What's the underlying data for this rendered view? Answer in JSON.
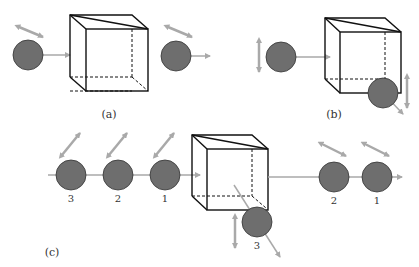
{
  "panels": {
    "a": {
      "label": "(a)"
    },
    "b": {
      "label": "(b)"
    },
    "c": {
      "label": "(c)",
      "incoming_labels": [
        "3",
        "2",
        "1"
      ],
      "outgoing_labels": [
        "2",
        "1"
      ],
      "deflected_label": "3"
    }
  },
  "colors": {
    "ball": "#6e6e6e",
    "arrow": "#a9a9a9",
    "cube": "#111111"
  }
}
